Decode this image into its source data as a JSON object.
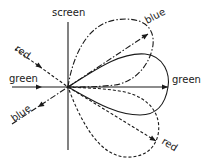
{
  "figure": {
    "labels": {
      "screen": "screen",
      "green_incident": "green",
      "red_incident": "red",
      "blue_incident": "blue",
      "green_lobe": "green",
      "blue_lobe": "blue",
      "red_lobe": "red"
    },
    "line_styles": {
      "green": "solid",
      "red": "dashed",
      "blue": "dash-dot"
    },
    "colors": {
      "ink": "#1a1a1a",
      "background": "#ffffff"
    }
  }
}
